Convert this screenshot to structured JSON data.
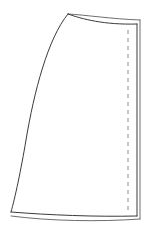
{
  "figure": {
    "type": "technical-line-drawing",
    "canvas": {
      "width": 154,
      "height": 229
    },
    "background_color": "#ffffff",
    "line_color": "#3a3a3a",
    "fill_color": "#ffffff",
    "stroke_width": 1,
    "paths": {
      "panel_outline": "M 68 14 C 48 38, 34 92, 26 140 C 21 170, 15 198, 11 212 C 45 216, 95 217, 137 216 L 137 24 C 118 26, 92 22, 80 17 Z",
      "top_edge_inner": "M 68 14 C 82 19, 104 25, 137 24",
      "top_edge_outer": "M 68 14 C 86 15, 112 19, 140 20",
      "right_edge_inner": "M 137 24 L 137 216",
      "right_edge_outer": "M 140 20 L 140 219",
      "bottom_edge_outer": "M 11 216 C 50 221, 98 222, 140 219",
      "left_edge": "M 68 14 C 48 38, 34 92, 26 140 C 21 170, 15 198, 11 212",
      "bottom_edge_inner": "M 11 212 C 48 215, 96 217, 137 216",
      "stitch_line": "M 128 30 L 128 212"
    },
    "stitch_line": {
      "label": "stitching guide line",
      "style": "dashed",
      "dash_pattern": "4 4",
      "x": 128,
      "y_start": 30,
      "y_end": 212
    },
    "corners": {
      "top_apex": [
        68,
        14
      ],
      "top_right_inner": [
        137,
        24
      ],
      "top_right_outer": [
        140,
        20
      ],
      "bottom_left": [
        11,
        212
      ],
      "bottom_right_inner": [
        137,
        216
      ],
      "bottom_right_outer": [
        140,
        219
      ]
    }
  }
}
